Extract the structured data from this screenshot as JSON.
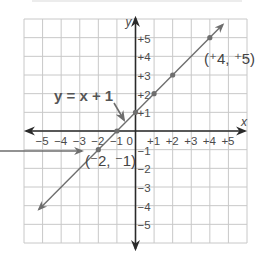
{
  "chart_data": {
    "type": "line",
    "title": "",
    "xlabel": "x",
    "ylabel": "y",
    "xlim": [
      -6,
      6
    ],
    "ylim": [
      -6,
      6
    ],
    "grid": true,
    "x_tick_labels": [
      "−5",
      "−4",
      "−3",
      "−2",
      "−1",
      "0",
      "+1",
      "+2",
      "+3",
      "+4",
      "+5"
    ],
    "y_tick_labels": [
      "+5",
      "+4",
      "+3",
      "+2",
      "+1",
      "−1",
      "−2",
      "−3",
      "−4",
      "−5"
    ],
    "series": [
      {
        "name": "y = x + 1",
        "equation": "y = x + 1",
        "points": [
          [
            -2,
            -1
          ],
          [
            -1,
            0
          ],
          [
            0,
            1
          ],
          [
            1,
            2
          ],
          [
            2,
            3
          ],
          [
            4,
            5
          ]
        ],
        "line_start": [
          -5.2,
          -4.2
        ],
        "line_end": [
          4.7,
          5.7
        ]
      }
    ],
    "annotations": [
      {
        "text": "y = x + 1",
        "points_to": [
          -0.6,
          0.4
        ]
      },
      {
        "text": "(⁺4, ⁺5)",
        "at": [
          4,
          5
        ]
      },
      {
        "text": "(⁻2, ⁻1)",
        "at": [
          -2,
          -1
        ]
      }
    ]
  },
  "labels": {
    "x_axis": "x",
    "y_axis": "y",
    "equation": "y = x + 1",
    "point_a": "(⁺4, ⁺5)",
    "point_b": "(⁻2, ⁻1)",
    "origin": "0"
  },
  "colors": {
    "grid": "#c8c8c8",
    "axis": "#2a2a2a",
    "line": "#6e6e6e",
    "text": "#4a4a4a"
  }
}
